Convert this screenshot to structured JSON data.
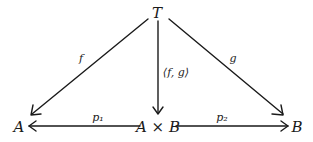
{
  "diagram": {
    "type": "commutative-diagram",
    "nodes": {
      "T": {
        "label": "T",
        "x": 157,
        "y": 13
      },
      "A": {
        "label": "A",
        "x": 19,
        "y": 127
      },
      "AxB": {
        "label": "A × B",
        "x": 158,
        "y": 127
      },
      "B": {
        "label": "B",
        "x": 297,
        "y": 127
      }
    },
    "arrows": [
      {
        "id": "f",
        "from": "T",
        "to": "A",
        "label": "f"
      },
      {
        "id": "pair",
        "from": "T",
        "to": "AxB",
        "label": "⟨f, g⟩"
      },
      {
        "id": "g",
        "from": "T",
        "to": "B",
        "label": "g"
      },
      {
        "id": "p1",
        "from": "AxB",
        "to": "A",
        "label": "p₁"
      },
      {
        "id": "p2",
        "from": "AxB",
        "to": "B",
        "label": "p₂"
      }
    ],
    "colors": {
      "ink": "#1a1a1a",
      "background": "#ffffff"
    }
  }
}
